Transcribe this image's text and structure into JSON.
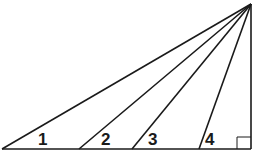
{
  "diagram": {
    "type": "geometry-figure",
    "stroke_color": "#1a1a1a",
    "apex": [
      251,
      4
    ],
    "base_y": 149,
    "base_left_x": 2,
    "right_x": 251,
    "cevian_feet_x": [
      79,
      132,
      199
    ],
    "right_angle_marker": {
      "x": 237,
      "y": 137,
      "size": 12
    },
    "angle_labels": [
      {
        "text": "1",
        "x": 43,
        "y": 145
      },
      {
        "text": "2",
        "x": 106,
        "y": 145
      },
      {
        "text": "3",
        "x": 153,
        "y": 145
      },
      {
        "text": "4",
        "x": 210,
        "y": 145
      }
    ]
  }
}
